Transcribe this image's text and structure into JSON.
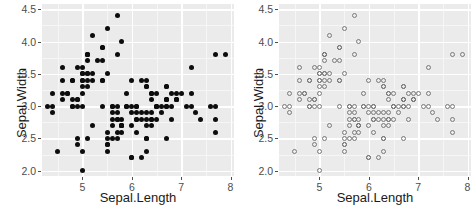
{
  "figure": {
    "width": 474,
    "height": 206,
    "background": "#ffffff",
    "panel_background": "#ebebeb",
    "gridline_color": "#ffffff",
    "n_panels": 2
  },
  "panels": [
    {
      "id": "panel-left",
      "marker_style": "filled-circle",
      "marker_color": "#0d0d0d",
      "xlabel": "Sepal.Length",
      "ylabel": "Sepal.Width"
    },
    {
      "id": "panel-right",
      "marker_style": "open-circle",
      "marker_color": "#7a7a7a",
      "xlabel": "Sepal.Length",
      "ylabel": "Sepal.Width"
    }
  ],
  "axes": {
    "x_ticks": [
      "5",
      "6",
      "7",
      "8"
    ],
    "x_tick_values": [
      5,
      6,
      7,
      8
    ],
    "y_ticks": [
      "2.0",
      "2.5",
      "3.0",
      "3.5",
      "4.0",
      "4.5"
    ],
    "y_tick_values": [
      2.0,
      2.5,
      3.0,
      3.5,
      4.0,
      4.5
    ],
    "x_minor_values": [
      4.5,
      5.5,
      6.5,
      7.5
    ],
    "y_minor_values": [
      2.25,
      2.75,
      3.25,
      3.75,
      4.25
    ],
    "xlim": [
      4.18,
      8.07
    ],
    "ylim": [
      1.92,
      4.58
    ]
  },
  "chart_data": {
    "type": "scatter",
    "title": "",
    "xlabel": "Sepal.Length",
    "ylabel": "Sepal.Width",
    "xlim": [
      4.18,
      8.07
    ],
    "ylim": [
      1.92,
      4.58
    ],
    "grid": true,
    "legend": "none",
    "n_points": 150,
    "series": [
      {
        "name": "Sepal.Width vs Sepal.Length (filled)",
        "panel": "panel-left",
        "marker": "filled-circle",
        "x": [
          5.1,
          4.9,
          4.7,
          4.6,
          5.0,
          5.4,
          4.6,
          5.0,
          4.4,
          4.9,
          5.4,
          4.8,
          4.8,
          4.3,
          5.8,
          5.7,
          5.4,
          5.1,
          5.7,
          5.1,
          5.4,
          5.1,
          4.6,
          5.1,
          4.8,
          5.0,
          5.0,
          5.2,
          5.2,
          4.7,
          4.8,
          5.4,
          5.2,
          5.5,
          4.9,
          5.0,
          5.5,
          4.9,
          4.4,
          5.1,
          5.0,
          4.5,
          4.4,
          5.0,
          5.1,
          4.8,
          5.1,
          4.6,
          5.3,
          5.0,
          7.0,
          6.4,
          6.9,
          5.5,
          6.5,
          5.7,
          6.3,
          4.9,
          6.6,
          5.2,
          5.0,
          5.9,
          6.0,
          6.1,
          5.6,
          6.7,
          5.6,
          5.8,
          6.2,
          5.6,
          5.9,
          6.1,
          6.3,
          6.1,
          6.4,
          6.6,
          6.8,
          6.7,
          6.0,
          5.7,
          5.5,
          5.5,
          5.8,
          6.0,
          5.4,
          6.0,
          6.7,
          6.3,
          5.6,
          5.5,
          5.5,
          6.1,
          5.8,
          5.0,
          5.6,
          5.7,
          5.7,
          6.2,
          5.1,
          5.7,
          6.3,
          5.8,
          7.1,
          6.3,
          6.5,
          7.6,
          4.9,
          7.3,
          6.7,
          7.2,
          6.5,
          6.4,
          6.8,
          5.7,
          5.8,
          6.4,
          6.5,
          7.7,
          7.7,
          6.0,
          6.9,
          5.6,
          7.7,
          6.3,
          6.7,
          7.2,
          6.2,
          6.1,
          6.4,
          7.2,
          7.4,
          7.9,
          6.4,
          6.3,
          6.1,
          7.7,
          6.3,
          6.4,
          6.0,
          6.9,
          6.7,
          6.9,
          5.8,
          6.8,
          6.7,
          6.7,
          6.3,
          6.5,
          6.2,
          5.9
        ],
        "y": [
          3.5,
          3.0,
          3.2,
          3.1,
          3.6,
          3.9,
          3.4,
          3.4,
          2.9,
          3.1,
          3.7,
          3.4,
          3.0,
          3.0,
          4.0,
          4.4,
          3.9,
          3.5,
          3.8,
          3.8,
          3.4,
          3.7,
          3.6,
          3.3,
          3.4,
          3.0,
          3.4,
          3.5,
          3.4,
          3.2,
          3.1,
          3.4,
          4.1,
          4.2,
          3.1,
          3.2,
          3.5,
          3.6,
          3.0,
          3.4,
          3.5,
          2.3,
          3.2,
          3.5,
          3.8,
          3.0,
          3.8,
          3.2,
          3.7,
          3.3,
          3.2,
          3.2,
          3.1,
          2.3,
          2.8,
          2.8,
          3.3,
          2.4,
          2.9,
          2.7,
          2.0,
          3.0,
          2.2,
          2.9,
          2.9,
          3.1,
          3.0,
          2.7,
          2.2,
          2.5,
          3.2,
          2.8,
          2.5,
          2.8,
          2.9,
          3.0,
          2.8,
          3.0,
          2.9,
          2.6,
          2.4,
          2.4,
          2.7,
          2.7,
          3.0,
          3.4,
          3.1,
          2.3,
          3.0,
          2.5,
          2.6,
          3.0,
          2.6,
          2.3,
          2.7,
          3.0,
          2.9,
          2.9,
          2.5,
          2.8,
          3.3,
          2.7,
          3.0,
          2.9,
          3.0,
          3.0,
          2.5,
          2.9,
          2.5,
          3.6,
          3.2,
          2.7,
          3.0,
          2.5,
          2.8,
          3.2,
          3.0,
          3.8,
          2.6,
          2.2,
          3.2,
          2.8,
          2.8,
          2.7,
          3.3,
          3.2,
          2.8,
          3.0,
          2.8,
          3.0,
          2.8,
          3.8,
          2.8,
          2.8,
          2.6,
          3.0,
          3.4,
          3.1,
          3.0,
          3.1,
          3.1,
          3.1,
          2.7,
          3.2,
          3.3,
          3.0,
          2.5,
          3.0,
          3.4,
          3.0
        ]
      },
      {
        "name": "Sepal.Width vs Sepal.Length (open)",
        "panel": "panel-right",
        "marker": "open-circle",
        "x": [
          5.1,
          4.9,
          4.7,
          4.6,
          5.0,
          5.4,
          4.6,
          5.0,
          4.4,
          4.9,
          5.4,
          4.8,
          4.8,
          4.3,
          5.8,
          5.7,
          5.4,
          5.1,
          5.7,
          5.1,
          5.4,
          5.1,
          4.6,
          5.1,
          4.8,
          5.0,
          5.0,
          5.2,
          5.2,
          4.7,
          4.8,
          5.4,
          5.2,
          5.5,
          4.9,
          5.0,
          5.5,
          4.9,
          4.4,
          5.1,
          5.0,
          4.5,
          4.4,
          5.0,
          5.1,
          4.8,
          5.1,
          4.6,
          5.3,
          5.0,
          7.0,
          6.4,
          6.9,
          5.5,
          6.5,
          5.7,
          6.3,
          4.9,
          6.6,
          5.2,
          5.0,
          5.9,
          6.0,
          6.1,
          5.6,
          6.7,
          5.6,
          5.8,
          6.2,
          5.6,
          5.9,
          6.1,
          6.3,
          6.1,
          6.4,
          6.6,
          6.8,
          6.7,
          6.0,
          5.7,
          5.5,
          5.5,
          5.8,
          6.0,
          5.4,
          6.0,
          6.7,
          6.3,
          5.6,
          5.5,
          5.5,
          6.1,
          5.8,
          5.0,
          5.6,
          5.7,
          5.7,
          6.2,
          5.1,
          5.7,
          6.3,
          5.8,
          7.1,
          6.3,
          6.5,
          7.6,
          4.9,
          7.3,
          6.7,
          7.2,
          6.5,
          6.4,
          6.8,
          5.7,
          5.8,
          6.4,
          6.5,
          7.7,
          7.7,
          6.0,
          6.9,
          5.6,
          7.7,
          6.3,
          6.7,
          7.2,
          6.2,
          6.1,
          6.4,
          7.2,
          7.4,
          7.9,
          6.4,
          6.3,
          6.1,
          7.7,
          6.3,
          6.4,
          6.0,
          6.9,
          6.7,
          6.9,
          5.8,
          6.8,
          6.7,
          6.7,
          6.3,
          6.5,
          6.2,
          5.9
        ],
        "y": [
          3.5,
          3.0,
          3.2,
          3.1,
          3.6,
          3.9,
          3.4,
          3.4,
          2.9,
          3.1,
          3.7,
          3.4,
          3.0,
          3.0,
          4.0,
          4.4,
          3.9,
          3.5,
          3.8,
          3.8,
          3.4,
          3.7,
          3.6,
          3.3,
          3.4,
          3.0,
          3.4,
          3.5,
          3.4,
          3.2,
          3.1,
          3.4,
          4.1,
          4.2,
          3.1,
          3.2,
          3.5,
          3.6,
          3.0,
          3.4,
          3.5,
          2.3,
          3.2,
          3.5,
          3.8,
          3.0,
          3.8,
          3.2,
          3.7,
          3.3,
          3.2,
          3.2,
          3.1,
          2.3,
          2.8,
          2.8,
          3.3,
          2.4,
          2.9,
          2.7,
          2.0,
          3.0,
          2.2,
          2.9,
          2.9,
          3.1,
          3.0,
          2.7,
          2.2,
          2.5,
          3.2,
          2.8,
          2.5,
          2.8,
          2.9,
          3.0,
          2.8,
          3.0,
          2.9,
          2.6,
          2.4,
          2.4,
          2.7,
          2.7,
          3.0,
          3.4,
          3.1,
          2.3,
          3.0,
          2.5,
          2.6,
          3.0,
          2.6,
          2.3,
          2.7,
          3.0,
          2.9,
          2.9,
          2.5,
          2.8,
          3.3,
          2.7,
          3.0,
          2.9,
          3.0,
          3.0,
          2.5,
          2.9,
          2.5,
          3.6,
          3.2,
          2.7,
          3.0,
          2.5,
          2.8,
          3.2,
          3.0,
          3.8,
          2.6,
          2.2,
          3.2,
          2.8,
          2.8,
          2.7,
          3.3,
          3.2,
          2.8,
          3.0,
          2.8,
          3.0,
          2.8,
          3.8,
          2.8,
          2.8,
          2.6,
          3.0,
          3.4,
          3.1,
          3.0,
          3.1,
          3.1,
          3.1,
          2.7,
          3.2,
          3.3,
          3.0,
          2.5,
          3.0,
          3.4,
          3.0
        ]
      }
    ]
  }
}
